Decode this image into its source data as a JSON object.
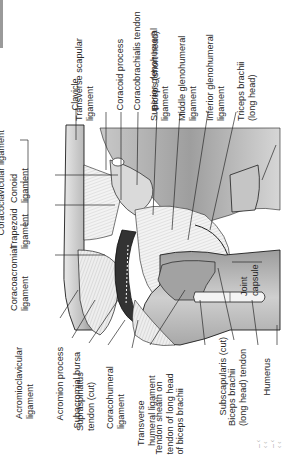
{
  "figure": {
    "orientation": "rotated 90 degrees counter-clockwise",
    "colors": {
      "background": "#ffffff",
      "bone_dark": "#8f8f8f",
      "bone_mid": "#b9b9b9",
      "bone_light": "#dcdcdc",
      "ligament": "#f2f2f2",
      "bursa": "#333333",
      "outline": "#1e1e1e"
    }
  },
  "labels": {
    "top": [
      {
        "id": "clavicle",
        "text": "Clavicle"
      },
      {
        "id": "transverse_scapular",
        "text": "Transverse scapular ligament"
      },
      {
        "id": "coracoid_process",
        "text": "Coracoid process"
      },
      {
        "id": "coracobrachialis_tendon",
        "text": "Coracobrachialis tendon"
      },
      {
        "id": "biceps_short",
        "text": "Biceps (short head)"
      },
      {
        "id": "superior_gh",
        "text": "Superior glenohumeral ligament"
      },
      {
        "id": "middle_gh",
        "text": "Middle glenohumeral ligament"
      },
      {
        "id": "inferior_gh",
        "text": "Inferior glenohumeral ligament"
      },
      {
        "id": "triceps_long",
        "text": "Triceps brachii (long head)"
      }
    ],
    "left": [
      {
        "id": "coracoclavicular",
        "text": "Coracoclavicular ligament"
      },
      {
        "id": "conoid",
        "text": "Conoid ligament"
      },
      {
        "id": "trapezoid",
        "text": "Trapezoid ligament"
      },
      {
        "id": "coracoacromial",
        "text": "Coracoacromial ligament"
      }
    ],
    "bottom": [
      {
        "id": "acromioclavicular",
        "text": "Acromioclavicular ligament"
      },
      {
        "id": "acromion",
        "text": "Acromion process"
      },
      {
        "id": "subacromial_bursa",
        "text": "Subacromial bursa"
      },
      {
        "id": "supraspinatus",
        "text": "Supraspinatus tendon (cut)"
      },
      {
        "id": "coracohumeral",
        "text": "Coracohumeral ligament"
      },
      {
        "id": "transverse_humeral",
        "text": "Transverse humeral ligament"
      },
      {
        "id": "tendon_sheath",
        "text": "Tendon sheath on tendon of long head of biceps brachii"
      },
      {
        "id": "subscapularis",
        "text": "Subscapularis (cut)"
      },
      {
        "id": "biceps_long_tendon",
        "text": "Biceps brachii (long head) tendon"
      },
      {
        "id": "humerus",
        "text": "Humerus"
      }
    ],
    "right": [
      {
        "id": "joint_capsule",
        "text": "Joint capsule"
      }
    ]
  },
  "text": {
    "clavicle": "Clavicle",
    "transverse_scapular_1": "Transverse scapular",
    "transverse_scapular_2": "ligament",
    "coracoid_process": "Coracoid process",
    "coracobrachialis_tendon": "Coracobrachialis tendon",
    "biceps_short": "Biceps (short head)",
    "superior_gh_1": "Superior glenohumeral",
    "superior_gh_2": "ligament",
    "middle_gh_1": "Middle glenohumeral",
    "middle_gh_2": "ligament",
    "inferior_gh_1": "Inferior glenohumeral",
    "inferior_gh_2": "ligament",
    "triceps_1": "Triceps brachii",
    "triceps_2": "(long head)",
    "coracoclavicular": "Coracoclavicular ligament",
    "conoid_1": "Conoid",
    "conoid_2": "ligament",
    "trapezoid_1": "Trapezoid",
    "trapezoid_2": "ligament",
    "coracoacromial_1": "Coracoacromial",
    "coracoacromial_2": "ligament",
    "acromioclavicular_1": "Acromioclavicular",
    "acromioclavicular_2": "ligament",
    "acromion": "Acromion process",
    "subacromial_bursa": "Subacromial bursa",
    "supraspinatus_1": "Supraspinatus",
    "supraspinatus_2": "tendon (cut)",
    "coracohumeral_1": "Coracohumeral",
    "coracohumeral_2": "ligament",
    "transverse_humeral_1": "Transverse",
    "transverse_humeral_2": "humeral ligament",
    "tendon_sheath_1": "Tendon sheath on",
    "tendon_sheath_2": "tendon of long head",
    "tendon_sheath_3": "of biceps brachii",
    "subscapularis": "Subscapularis (cut)",
    "biceps_long_1": "Biceps brachii",
    "biceps_long_2": "(long head) tendon",
    "humerus": "Humerus",
    "joint_capsule_1": "Joint",
    "joint_capsule_2": "capsule",
    "edge_marks": "– ‹ ‹   ‹   – ‹ ‹   ‹"
  }
}
